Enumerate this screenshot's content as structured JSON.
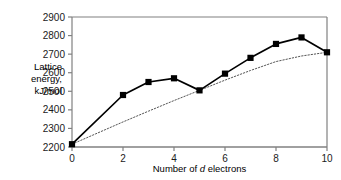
{
  "chart_data": {
    "type": "line",
    "title": "",
    "xlabel": "Number of d electrons",
    "ylabel": "Lattice energy, kJ/mol",
    "ylabel_lines": [
      "Lattice",
      "energy,",
      "kJ/mol"
    ],
    "xlabel_parts": {
      "pre": "Number of ",
      "italic": "d",
      "post": " electrons"
    },
    "x": [
      0,
      1,
      2,
      3,
      4,
      5,
      6,
      7,
      8,
      9,
      10
    ],
    "xlim": [
      0,
      10
    ],
    "ylim": [
      2200,
      2900
    ],
    "xticks": [
      0,
      2,
      4,
      6,
      8,
      10
    ],
    "xtick_labels": [
      "0",
      "2",
      "4",
      "6",
      "8",
      "10"
    ],
    "yticks": [
      2200,
      2300,
      2400,
      2500,
      2600,
      2700,
      2800,
      2900
    ],
    "ytick_labels": [
      "2200",
      "2300",
      "2400",
      "2500",
      "2600",
      "2700",
      "2800",
      "2900"
    ],
    "grid": false,
    "legend": "none",
    "series": [
      {
        "name": "measured-lattice-energy",
        "style": "solid-with-square-markers",
        "color": "#000000",
        "marker": "square",
        "x": [
          0,
          2,
          3,
          4,
          5,
          6,
          7,
          8,
          9,
          10
        ],
        "values": [
          2215,
          2480,
          2550,
          2570,
          2505,
          2595,
          2680,
          2755,
          2790,
          2710
        ]
      },
      {
        "name": "reference-trend-line",
        "style": "dotted",
        "color": "#555555",
        "marker": "none",
        "x": [
          0,
          1,
          2,
          3,
          4,
          5,
          6,
          7,
          8,
          9,
          10
        ],
        "values": [
          2215,
          2275,
          2335,
          2393,
          2450,
          2505,
          2560,
          2612,
          2660,
          2690,
          2710
        ]
      }
    ]
  },
  "colors": {
    "axis": "#808080",
    "line": "#000000",
    "dotted": "#555555",
    "background": "#ffffff"
  }
}
